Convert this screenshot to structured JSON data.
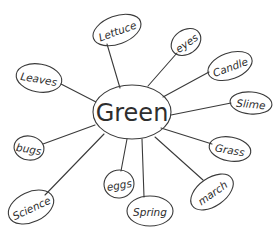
{
  "diagram": {
    "type": "mind-map",
    "style": "hand-drawn",
    "colors": {
      "background": "#ffffff",
      "ink": "#3a3a3a"
    },
    "center": {
      "label": "Green",
      "cx": 132,
      "cy": 112,
      "rx": 39,
      "ry": 27
    },
    "nodes": [
      {
        "id": "lettuce",
        "label": "Lettuce",
        "cx": 117,
        "cy": 30,
        "rx": 25,
        "ry": 14,
        "rot": -20,
        "line": [
          120,
          88,
          107,
          44
        ]
      },
      {
        "id": "eyes",
        "label": "eyes",
        "cx": 186,
        "cy": 42,
        "rx": 16,
        "ry": 12,
        "rot": -35,
        "line": [
          148,
          86,
          177,
          53
        ]
      },
      {
        "id": "candle",
        "label": "Candle",
        "cx": 230,
        "cy": 66,
        "rx": 23,
        "ry": 13,
        "rot": -20,
        "line": [
          163,
          97,
          209,
          72
        ]
      },
      {
        "id": "slime",
        "label": "Slime",
        "cx": 251,
        "cy": 103,
        "rx": 21,
        "ry": 11,
        "rot": 5,
        "line": [
          171,
          115,
          231,
          103
        ]
      },
      {
        "id": "grass",
        "label": "Grass",
        "cx": 230,
        "cy": 149,
        "rx": 21,
        "ry": 12,
        "rot": 10,
        "line": [
          161,
          128,
          212,
          144
        ]
      },
      {
        "id": "march",
        "label": "march",
        "cx": 212,
        "cy": 192,
        "rx": 24,
        "ry": 14,
        "rot": -35,
        "line": [
          155,
          137,
          203,
          180
        ]
      },
      {
        "id": "spring",
        "label": "Spring",
        "cx": 150,
        "cy": 211,
        "rx": 23,
        "ry": 15,
        "rot": 0,
        "line": [
          142,
          139,
          144,
          197
        ]
      },
      {
        "id": "eggs",
        "label": "eggs",
        "cx": 119,
        "cy": 184,
        "rx": 15,
        "ry": 14,
        "rot": -10,
        "line": [
          127,
          139,
          121,
          171
        ]
      },
      {
        "id": "science",
        "label": "Science",
        "cx": 31,
        "cy": 207,
        "rx": 24,
        "ry": 15,
        "rot": -25,
        "line": [
          104,
          134,
          45,
          195
        ]
      },
      {
        "id": "bugs",
        "label": "bugs",
        "cx": 29,
        "cy": 148,
        "rx": 15,
        "ry": 12,
        "rot": 10,
        "line": [
          95,
          125,
          43,
          144
        ]
      },
      {
        "id": "leaves",
        "label": "Leaves",
        "cx": 39,
        "cy": 78,
        "rx": 23,
        "ry": 14,
        "rot": 10,
        "line": [
          96,
          102,
          61,
          84
        ]
      }
    ]
  }
}
